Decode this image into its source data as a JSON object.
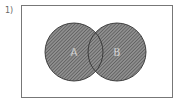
{
  "problem": {
    "number_label": "1)"
  },
  "diagram": {
    "type": "venn",
    "universal_set": {
      "x": 21,
      "y": 5,
      "width": 151,
      "height": 92,
      "stroke": "#777777"
    },
    "sets": [
      {
        "label": "A",
        "cx": 74,
        "cy": 52,
        "r": 29,
        "shaded": true
      },
      {
        "label": "B",
        "cx": 117,
        "cy": 52,
        "r": 29,
        "shaded": true
      }
    ],
    "shaded_region": "A ∪ B",
    "colors": {
      "hatch_fill": "#8a8a8a",
      "hatch_line": "#555555",
      "circle_stroke": "#333333",
      "label_color": "#ffffff"
    }
  }
}
